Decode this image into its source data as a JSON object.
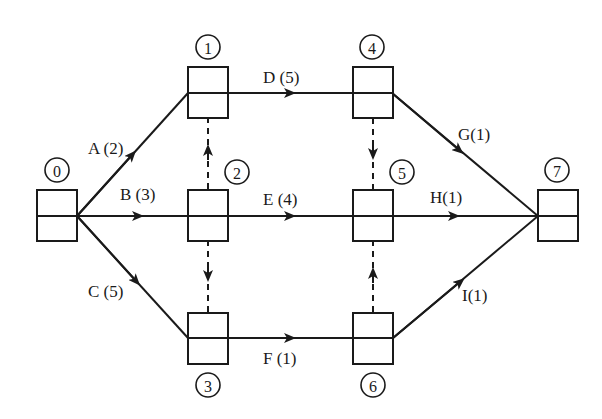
{
  "diagram": {
    "type": "activity-on-arrow network",
    "nodes": [
      {
        "id": "0",
        "label": "0"
      },
      {
        "id": "1",
        "label": "1"
      },
      {
        "id": "2",
        "label": "2"
      },
      {
        "id": "3",
        "label": "3"
      },
      {
        "id": "4",
        "label": "4"
      },
      {
        "id": "5",
        "label": "5"
      },
      {
        "id": "6",
        "label": "6"
      },
      {
        "id": "7",
        "label": "7"
      }
    ],
    "activities": [
      {
        "from": "0",
        "to": "1",
        "label": "A (2)",
        "name": "A",
        "duration": 2
      },
      {
        "from": "0",
        "to": "2",
        "label": "B (3)",
        "name": "B",
        "duration": 3
      },
      {
        "from": "0",
        "to": "3",
        "label": "C (5)",
        "name": "C",
        "duration": 5
      },
      {
        "from": "1",
        "to": "4",
        "label": "D (5)",
        "name": "D",
        "duration": 5
      },
      {
        "from": "2",
        "to": "5",
        "label": "E (4)",
        "name": "E",
        "duration": 4
      },
      {
        "from": "3",
        "to": "6",
        "label": "F (1)",
        "name": "F",
        "duration": 1
      },
      {
        "from": "4",
        "to": "7",
        "label": "G(1)",
        "name": "G",
        "duration": 1
      },
      {
        "from": "5",
        "to": "7",
        "label": "H(1)",
        "name": "H",
        "duration": 1
      },
      {
        "from": "6",
        "to": "7",
        "label": "I(1)",
        "name": "I",
        "duration": 1
      }
    ],
    "dummies": [
      {
        "from": "2",
        "to": "1"
      },
      {
        "from": "2",
        "to": "3"
      },
      {
        "from": "4",
        "to": "5"
      },
      {
        "from": "6",
        "to": "5"
      }
    ]
  }
}
